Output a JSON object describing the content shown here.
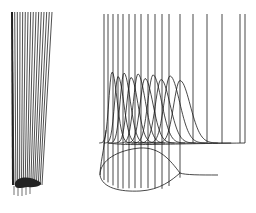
{
  "figure": {
    "stroke_color": "#1a1a1a",
    "background": "#ffffff",
    "left_panel": {
      "label": "",
      "line_count": 16,
      "top_x_range": [
        12,
        52
      ],
      "bottom_x_range": [
        14,
        42
      ],
      "top_y": 12,
      "bottom_y": 185
    },
    "right_panel": {
      "label": "",
      "vertical_line_count": 17,
      "bell_curve_count": 10,
      "top_y": 14
    }
  }
}
